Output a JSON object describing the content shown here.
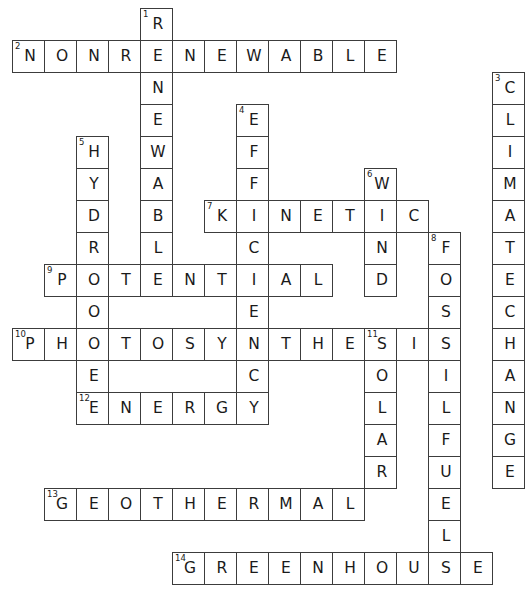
{
  "puzzle": {
    "kind": "crossword-grid",
    "theme": "energy-and-climate",
    "grid": {
      "cols": 16,
      "rows": 19,
      "cell_size": 32,
      "origin_x": 12,
      "origin_y": 8,
      "border_color": "#3c3c3c",
      "cell_fill": "#ffffff",
      "letter_color": "#1a1a1a",
      "number_color": "#1a1a1a"
    },
    "entries": [
      {
        "number": "1",
        "answer": "RENEWABLE",
        "direction": "down",
        "row": 0,
        "col": 4,
        "length": 9
      },
      {
        "number": "2",
        "answer": "NONRENEWABLE",
        "direction": "across",
        "row": 1,
        "col": 0,
        "length": 12
      },
      {
        "number": "3",
        "answer": "CLIMATECHANGE",
        "direction": "down",
        "row": 2,
        "col": 15,
        "length": 13
      },
      {
        "number": "4",
        "answer": "EFFICIENCY",
        "direction": "down",
        "row": 3,
        "col": 7,
        "length": 10
      },
      {
        "number": "5",
        "answer": "HYDRO",
        "direction": "down",
        "row": 4,
        "col": 2,
        "length": 5
      },
      {
        "number": "6",
        "answer": "WIND",
        "direction": "down",
        "row": 5,
        "col": 11,
        "length": 4
      },
      {
        "number": "7",
        "answer": "KINETIC",
        "direction": "across",
        "row": 6,
        "col": 6,
        "length": 7
      },
      {
        "number": "8",
        "answer": "FOSSILFUELS",
        "direction": "down",
        "row": 7,
        "col": 13,
        "length": 11
      },
      {
        "number": "9",
        "answer": "POTENTIAL",
        "direction": "across",
        "row": 8,
        "col": 1,
        "length": 9
      },
      {
        "number": "10",
        "answer": "PHOTOSYNTHESIS",
        "direction": "across",
        "row": 10,
        "col": 0,
        "length": 14
      },
      {
        "number": "11",
        "answer": "SOLAR",
        "direction": "down",
        "row": 10,
        "col": 11,
        "length": 5
      },
      {
        "number": "12",
        "answer": "ENERGY",
        "direction": "across",
        "row": 12,
        "col": 2,
        "length": 6
      },
      {
        "number": "13",
        "answer": "GEOTHERMAL",
        "direction": "across",
        "row": 15,
        "col": 1,
        "length": 10
      },
      {
        "number": "14",
        "answer": "GREENHOUSE",
        "direction": "across",
        "row": 17,
        "col": 5,
        "length": 10
      },
      {
        "number": "",
        "answer": "POWER",
        "direction": "down",
        "row": 8,
        "col": 2,
        "length": 5
      }
    ]
  }
}
